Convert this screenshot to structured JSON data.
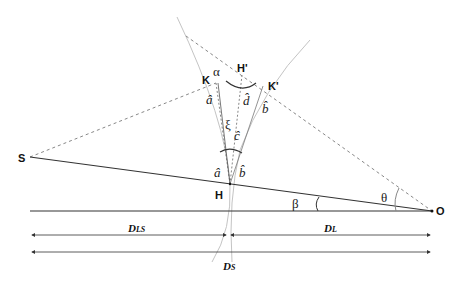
{
  "diagram": {
    "points": {
      "S": {
        "label": "S",
        "x": 30,
        "y": 157
      },
      "O": {
        "label": "O",
        "x": 432,
        "y": 211
      },
      "H": {
        "label": "H",
        "x": 230,
        "y": 184
      },
      "K": {
        "label": "K",
        "x": 216,
        "y": 83
      },
      "K_prime": {
        "label": "K'",
        "x": 263,
        "y": 86
      },
      "H_prime": {
        "label": "H'",
        "x": 242,
        "y": 75
      }
    },
    "angles": {
      "alpha": "α",
      "a_hat_top": "â",
      "d_hat": "d̂",
      "b_hat_top": "b̂",
      "xi": "ξ",
      "c_hat": "ĉ",
      "a_hat_bottom": "â",
      "b_hat_bottom": "b̂",
      "beta": "β",
      "theta": "θ"
    },
    "distances": {
      "DLS": {
        "main": "D",
        "sub": "LS"
      },
      "DL": {
        "main": "D",
        "sub": "L"
      },
      "DS": {
        "main": "D",
        "sub": "S"
      }
    },
    "colors": {
      "solid_line": "#333333",
      "dashed_line": "#888888",
      "curve": "#bbbbbb"
    }
  }
}
